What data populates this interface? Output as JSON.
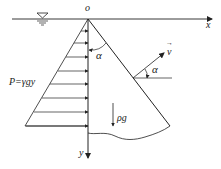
{
  "diagram": {
    "title": "",
    "colors": {
      "stroke": "#222222",
      "background": "#ffffff"
    },
    "labels": {
      "origin": "o",
      "x_axis": "x",
      "y_axis": "y",
      "angle_top": "α",
      "angle_right": "α",
      "velocity": "v",
      "velocity_arrow": "→",
      "weight": "ρg",
      "pressure": "P=γgy"
    },
    "elements": {
      "water_surface_symbol": "water-level-triangle",
      "pressure_arrows_count": 8
    }
  }
}
